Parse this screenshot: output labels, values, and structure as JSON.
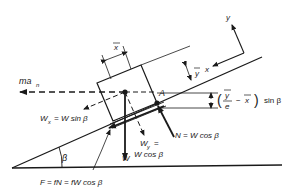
{
  "diagram": {
    "type": "free-body-diagram",
    "labels": {
      "inertia_force": "ma",
      "inertia_force_sub": "n",
      "x_bar": "x",
      "y_bar": "y",
      "axis_x": "x",
      "axis_y": "y",
      "point_A": "A",
      "moment_arm_open": "(",
      "moment_arm_num": "y",
      "moment_arm_den": "e",
      "moment_arm_minus": "−",
      "moment_arm_x": "x",
      "moment_arm_close": ")",
      "moment_arm_tail": "sin β",
      "wx_label": "W",
      "wx_sub": "x",
      "wx_eq": "= W sin β",
      "wy_label": "W",
      "wy_sub": "y",
      "wy_eq": "=",
      "wy_eq2": "W cos β",
      "weight": "W",
      "normal": "N = W cos β",
      "friction": "F = fN = fW cos β",
      "angle": "β"
    },
    "colors": {
      "stroke": "#1a1a1a",
      "background": "#ffffff"
    }
  }
}
